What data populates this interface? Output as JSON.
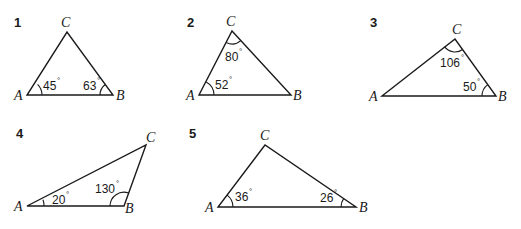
{
  "triangles": [
    {
      "number": "1",
      "vertices": {
        "A": "A",
        "B": "B",
        "C": "C"
      },
      "angles": {
        "A": "45",
        "B": "63"
      }
    },
    {
      "number": "2",
      "vertices": {
        "A": "A",
        "B": "B",
        "C": "C"
      },
      "angles": {
        "A": "52",
        "C": "80"
      }
    },
    {
      "number": "3",
      "vertices": {
        "A": "A",
        "B": "B",
        "C": "C"
      },
      "angles": {
        "C": "106",
        "B": "50"
      }
    },
    {
      "number": "4",
      "vertices": {
        "A": "A",
        "B": "B",
        "C": "C"
      },
      "angles": {
        "A": "20",
        "B": "130"
      }
    },
    {
      "number": "5",
      "vertices": {
        "A": "A",
        "B": "B",
        "C": "C"
      },
      "angles": {
        "A": "36",
        "B": "26"
      }
    }
  ],
  "degree_symbol": "°"
}
